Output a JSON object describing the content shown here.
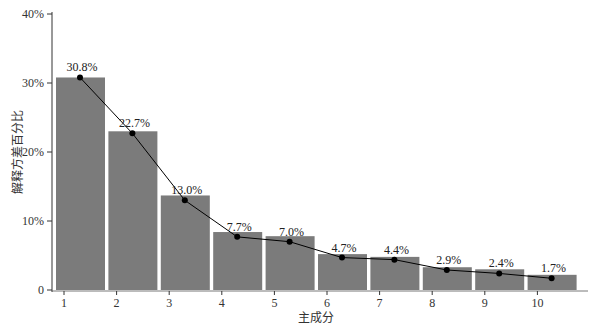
{
  "chart_data": {
    "type": "bar",
    "title": "",
    "xlabel": "主成分",
    "ylabel": "解释方差百分比",
    "categories": [
      "1",
      "2",
      "3",
      "4",
      "5",
      "6",
      "7",
      "8",
      "9",
      "10"
    ],
    "values": [
      30.8,
      22.7,
      13.0,
      7.7,
      7.0,
      4.7,
      4.4,
      2.9,
      2.4,
      1.7
    ],
    "bar_heights": [
      30.8,
      23.0,
      13.7,
      8.4,
      7.8,
      5.2,
      4.8,
      3.3,
      3.0,
      2.2
    ],
    "value_labels": [
      "30.8%",
      "22.7%",
      "13.0%",
      "7.7%",
      "7.0%",
      "4.7%",
      "4.4%",
      "2.9%",
      "2.4%",
      "1.7%"
    ],
    "series": [
      {
        "name": "bars",
        "type": "bar",
        "values": [
          30.8,
          23.0,
          13.7,
          8.4,
          7.8,
          5.2,
          4.8,
          3.3,
          3.0,
          2.2
        ]
      },
      {
        "name": "line",
        "type": "line",
        "values": [
          30.8,
          22.7,
          13.0,
          7.7,
          7.0,
          4.7,
          4.4,
          2.9,
          2.4,
          1.7
        ]
      }
    ],
    "yticks": [
      0,
      10,
      20,
      30,
      40
    ],
    "ytick_labels": [
      "0",
      "10%",
      "20%",
      "30%",
      "40%"
    ],
    "ylim": [
      0,
      40
    ],
    "grid": false,
    "legend": "none",
    "colors": {
      "bar": "#7b7b7b",
      "line": "#000000",
      "marker": "#000000",
      "axis": "#333333"
    }
  }
}
